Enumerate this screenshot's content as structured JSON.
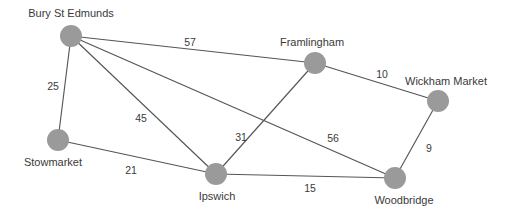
{
  "diagram": {
    "type": "weighted-undirected-graph",
    "width": 514,
    "height": 215,
    "colors": {
      "background": "#ffffff",
      "node_fill": "#9a9a9a",
      "edge_stroke": "#555555",
      "text": "#3a3a3a"
    },
    "nodes": [
      {
        "id": "bury",
        "label": "Bury St Edmunds",
        "cx": 71,
        "cy": 36,
        "r": 11,
        "label_x": 71,
        "label_y": 13
      },
      {
        "id": "framlingham",
        "label": "Framlingham",
        "cx": 315,
        "cy": 63,
        "r": 11,
        "label_x": 312,
        "label_y": 42
      },
      {
        "id": "wickham",
        "label": "Wickham Market",
        "cx": 438,
        "cy": 101,
        "r": 11,
        "label_x": 446,
        "label_y": 81
      },
      {
        "id": "stowmarket",
        "label": "Stowmarket",
        "cx": 58,
        "cy": 140,
        "r": 11,
        "label_x": 53,
        "label_y": 162
      },
      {
        "id": "ipswich",
        "label": "Ipswich",
        "cx": 216,
        "cy": 174,
        "r": 11,
        "label_x": 217,
        "label_y": 196
      },
      {
        "id": "woodbridge",
        "label": "Woodbridge",
        "cx": 395,
        "cy": 178,
        "r": 11,
        "label_x": 404,
        "label_y": 200
      }
    ],
    "edges": [
      {
        "from": "bury",
        "to": "framlingham",
        "weight": 57,
        "label_x": 190,
        "label_y": 42
      },
      {
        "from": "bury",
        "to": "stowmarket",
        "weight": 25,
        "label_x": 53,
        "label_y": 86
      },
      {
        "from": "bury",
        "to": "ipswich",
        "weight": 45,
        "label_x": 141,
        "label_y": 118
      },
      {
        "from": "bury",
        "to": "woodbridge",
        "weight": 56,
        "label_x": 333,
        "label_y": 138
      },
      {
        "from": "framlingham",
        "to": "wickham",
        "weight": 10,
        "label_x": 382,
        "label_y": 74
      },
      {
        "from": "framlingham",
        "to": "ipswich",
        "weight": 31,
        "label_x": 241,
        "label_y": 137
      },
      {
        "from": "wickham",
        "to": "woodbridge",
        "weight": 9,
        "label_x": 429,
        "label_y": 148
      },
      {
        "from": "stowmarket",
        "to": "ipswich",
        "weight": 21,
        "label_x": 131,
        "label_y": 170
      },
      {
        "from": "ipswich",
        "to": "woodbridge",
        "weight": 15,
        "label_x": 310,
        "label_y": 188
      }
    ]
  }
}
